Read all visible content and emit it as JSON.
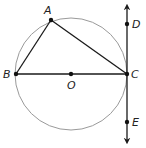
{
  "diagram": {
    "type": "geometry",
    "colors": {
      "circle": "#9a9a9a",
      "lines": "#1a1a1a",
      "points": "#111111",
      "background": "#ffffff"
    },
    "circle": {
      "center": "O",
      "cx": 71,
      "cy": 74,
      "r": 56
    },
    "points": [
      {
        "id": "A",
        "label": "A",
        "x": 51,
        "y": 20,
        "lx": 44,
        "ly": 14
      },
      {
        "id": "B",
        "label": "B",
        "x": 16,
        "y": 74,
        "lx": 3,
        "ly": 78
      },
      {
        "id": "O",
        "label": "O",
        "x": 71,
        "y": 74,
        "lx": 67,
        "ly": 89
      },
      {
        "id": "C",
        "label": "C",
        "x": 127,
        "y": 74,
        "lx": 131,
        "ly": 78
      },
      {
        "id": "D",
        "label": "D",
        "x": 127,
        "y": 24,
        "lx": 132,
        "ly": 28
      },
      {
        "id": "E",
        "label": "E",
        "x": 127,
        "y": 122,
        "lx": 132,
        "ly": 126
      }
    ],
    "segments": [
      {
        "from": "A",
        "to": "B"
      },
      {
        "from": "A",
        "to": "C"
      },
      {
        "from": "B",
        "to": "C"
      }
    ],
    "tangent_line": {
      "through": [
        "D",
        "C",
        "E"
      ],
      "x": 127,
      "y_top": 4,
      "y_bottom": 144,
      "arrows": "both"
    }
  }
}
